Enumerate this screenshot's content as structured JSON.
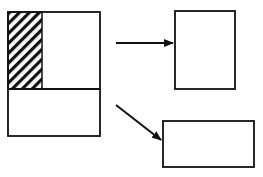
{
  "diagram": {
    "width": 263,
    "height": 177,
    "stroke_color": "#111111",
    "background": "#ffffff",
    "source_block": {
      "outer": {
        "x": 8,
        "y": 12,
        "w": 92,
        "h": 124
      },
      "divider_y": 89,
      "hatched_region": {
        "x": 8,
        "y": 12,
        "w": 34,
        "h": 77
      }
    },
    "target_top": {
      "x": 175,
      "y": 11,
      "w": 60,
      "h": 78
    },
    "target_bottom": {
      "x": 163,
      "y": 121,
      "w": 91,
      "h": 46
    },
    "arrows": [
      {
        "name": "arrow-to-top-box",
        "x1": 116,
        "y1": 43,
        "x2": 173,
        "y2": 43
      },
      {
        "name": "arrow-to-bottom-box",
        "x1": 116,
        "y1": 105,
        "x2": 161,
        "y2": 140
      }
    ]
  }
}
